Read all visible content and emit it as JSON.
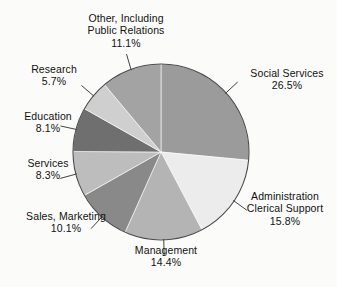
{
  "chart_data": {
    "type": "pie",
    "title": "",
    "subtitle": "",
    "xlabel": "",
    "ylabel": "",
    "legend_position": "none",
    "grid": false,
    "label_format": "name + percent",
    "start_angle_deg": 0,
    "direction": "clockwise",
    "units": "percent",
    "categories": [
      "Social Services",
      "Administration Clerical Support",
      "Management",
      "Sales, Marketing",
      "Services",
      "Education",
      "Research",
      "Other, Including Public Relations"
    ],
    "values": [
      26.5,
      15.8,
      14.4,
      10.1,
      8.3,
      8.1,
      5.7,
      11.1
    ],
    "slices": [
      {
        "name": "Social Services",
        "label_line1": "Social Services",
        "label_line2": "",
        "percent_text": "26.5%",
        "value": 26.5,
        "color": "#9b9b9b",
        "label_position": "right"
      },
      {
        "name": "Administration Clerical Support",
        "label_line1": "Administration",
        "label_line2": "Clerical Support",
        "percent_text": "15.8%",
        "value": 15.8,
        "color": "#ececec",
        "label_position": "right"
      },
      {
        "name": "Management",
        "label_line1": "Management",
        "label_line2": "",
        "percent_text": "14.4%",
        "value": 14.4,
        "color": "#b4b4b4",
        "label_position": "bottom"
      },
      {
        "name": "Sales, Marketing",
        "label_line1": "Sales, Marketing",
        "label_line2": "",
        "percent_text": "10.1%",
        "value": 10.1,
        "color": "#898989",
        "label_position": "left"
      },
      {
        "name": "Services",
        "label_line1": "Services",
        "label_line2": "",
        "percent_text": "8.3%",
        "value": 8.3,
        "color": "#bdbdbd",
        "label_position": "left"
      },
      {
        "name": "Education",
        "label_line1": "Education",
        "label_line2": "",
        "percent_text": "8.1%",
        "value": 8.1,
        "color": "#6f6f6f",
        "label_position": "left"
      },
      {
        "name": "Research",
        "label_line1": "Research",
        "label_line2": "",
        "percent_text": "5.7%",
        "value": 5.7,
        "color": "#cfcfcf",
        "label_position": "left"
      },
      {
        "name": "Other, Including Public Relations",
        "label_line1": "Other, Including",
        "label_line2": "Public Relations",
        "percent_text": "11.1%",
        "value": 11.1,
        "color": "#a3a3a3",
        "label_position": "top"
      }
    ],
    "geometry": {
      "center_x": 161,
      "center_y": 152,
      "radius": 88
    },
    "colors": {
      "background": "#fbfbfa",
      "outline": "#4a4a4a",
      "leader_line": "#2e2e2e",
      "text": "#111111"
    }
  }
}
